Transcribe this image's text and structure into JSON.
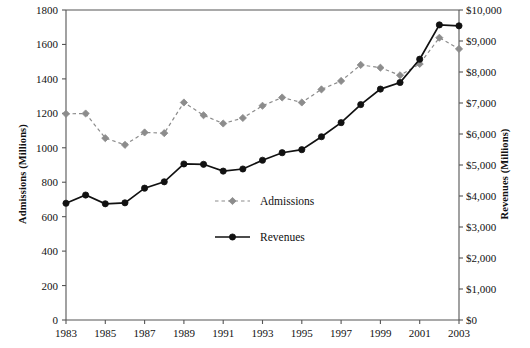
{
  "chart_data": {
    "type": "line",
    "title": "",
    "xlabel": "",
    "ylabel": "Admissions (Millions)",
    "y2label": "Revenues (Millions)",
    "x": [
      1983,
      1984,
      1985,
      1986,
      1987,
      1988,
      1989,
      1990,
      1991,
      1992,
      1993,
      1994,
      1995,
      1996,
      1997,
      1998,
      1999,
      2000,
      2001,
      2002,
      2003
    ],
    "xlim": [
      1983,
      2003
    ],
    "ylim": [
      0,
      1800
    ],
    "y2lim": [
      0,
      10000
    ],
    "grid": false,
    "legend_position": "center",
    "xtick_labels": [
      "1983",
      "1985",
      "1987",
      "1989",
      "1991",
      "1993",
      "1995",
      "1997",
      "1999",
      "2001",
      "2003"
    ],
    "ytick_labels": [
      "0",
      "200",
      "400",
      "600",
      "800",
      "1000",
      "1200",
      "1400",
      "1600",
      "1800"
    ],
    "ytick_values": [
      0,
      200,
      400,
      600,
      800,
      1000,
      1200,
      1400,
      1600,
      1800
    ],
    "y2tick_labels": [
      "$0",
      "$1,000",
      "$2,000",
      "$3,000",
      "$4,000",
      "$5,000",
      "$6,000",
      "$7,000",
      "$8,000",
      "$9,000",
      "$10,000"
    ],
    "y2tick_values": [
      0,
      1000,
      2000,
      3000,
      4000,
      5000,
      6000,
      7000,
      8000,
      9000,
      10000
    ],
    "series": [
      {
        "name": "Admissions",
        "axis": "left",
        "color": "#8c8c8c",
        "linestyle": "dashed",
        "marker": "diamond",
        "units": "Millions of admissions",
        "values": [
          1197,
          1199,
          1056,
          1017,
          1089,
          1085,
          1263,
          1189,
          1141,
          1173,
          1244,
          1292,
          1263,
          1339,
          1388,
          1481,
          1465,
          1421,
          1487,
          1639,
          1574
        ]
      },
      {
        "name": "Revenues",
        "axis": "right",
        "color": "#111111",
        "linestyle": "solid",
        "marker": "circle",
        "units": "Millions of dollars",
        "values": [
          3766,
          4031,
          3749,
          3780,
          4253,
          4458,
          5033,
          5022,
          4803,
          4871,
          5154,
          5396,
          5494,
          5912,
          6366,
          6949,
          7448,
          7661,
          8413,
          9520,
          9489
        ]
      }
    ],
    "series_left_scale_equivalent": {
      "Revenues_in_left_axis_units": [
        678,
        726,
        675,
        680,
        766,
        802,
        906,
        904,
        865,
        877,
        928,
        971,
        989,
        1064,
        1146,
        1251,
        1341,
        1379,
        1514,
        1714,
        1708
      ]
    }
  },
  "legend": {
    "items": [
      {
        "label": "Admissions"
      },
      {
        "label": "Revenues"
      }
    ]
  }
}
